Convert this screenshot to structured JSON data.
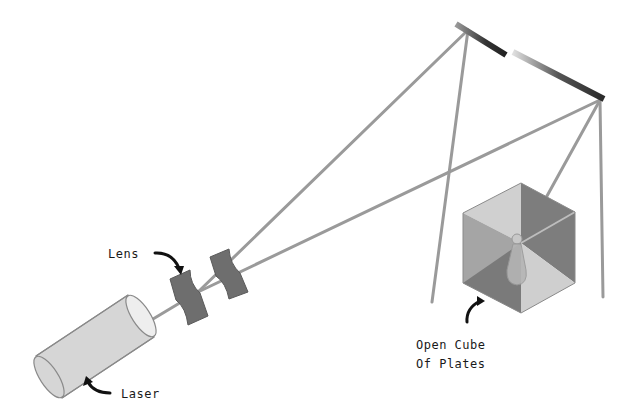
{
  "diagram": {
    "labels": {
      "lens": "Lens",
      "laser": "Laser",
      "cube_line1": "Open Cube",
      "cube_line2": "Of Plates"
    },
    "components": [
      "laser",
      "lens-1",
      "lens-2",
      "mirror-1",
      "mirror-2",
      "open-cube-of-plates",
      "object-pawn"
    ],
    "colors": {
      "beam": "#9a9a9a",
      "laser_body": "#d6d6d6",
      "lens": "#6e6e6e",
      "mirror": "#333333",
      "cube_light": "#cfcfcf",
      "cube_mid": "#9c9c9c",
      "cube_dark": "#7d7d7d",
      "text": "#1a1a1a"
    }
  }
}
